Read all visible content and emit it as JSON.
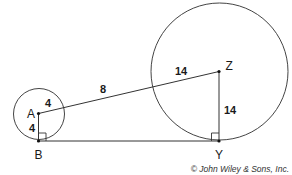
{
  "diagram": {
    "points": {
      "A": {
        "label": "A"
      },
      "B": {
        "label": "B"
      },
      "Z": {
        "label": "Z"
      },
      "Y": {
        "label": "Y"
      }
    },
    "segments": {
      "small_radius_AZ_side": "4",
      "small_radius_AB": "4",
      "AZ_outside": "8",
      "large_radius_Z_side": "14",
      "large_radius_ZY": "14"
    },
    "credit": "© John Wiley & Sons, Inc.",
    "line_color": "#333333"
  }
}
